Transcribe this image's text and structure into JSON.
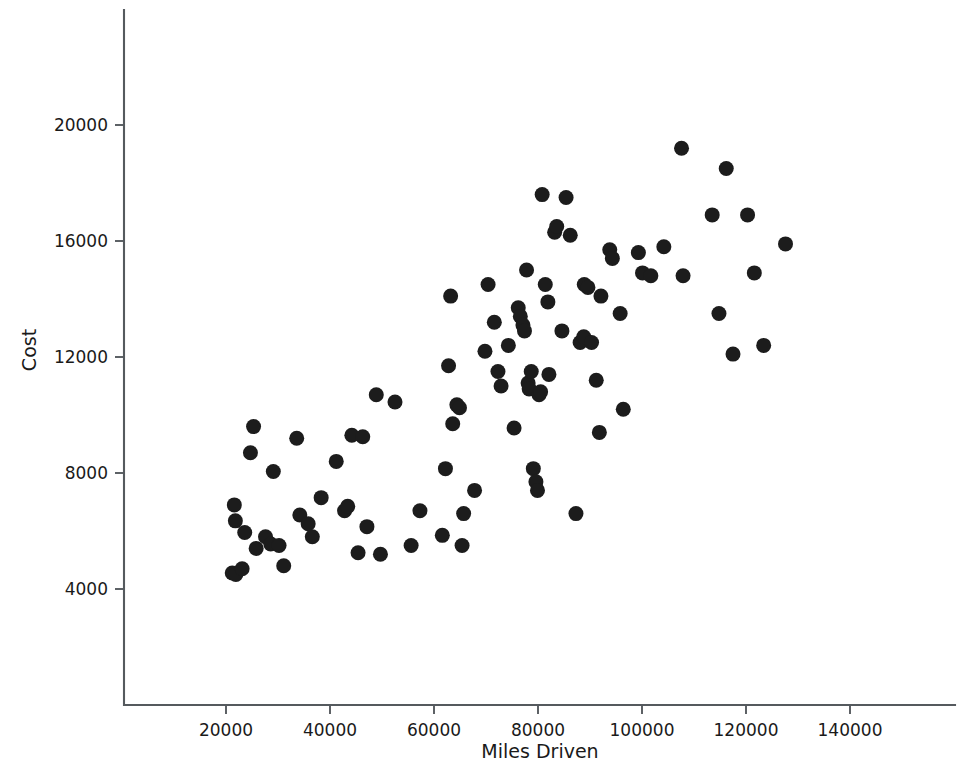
{
  "figure": {
    "background_color": "#ffffff",
    "marker_color": "#1c1c1c",
    "axis_color": "#555a5e",
    "line_color": "#2a2a2a"
  },
  "axes": {
    "x_title": "Miles Driven",
    "y_title": "Cost",
    "x_ticks": [
      "20000",
      "40000",
      "60000",
      "80000",
      "100000",
      "120000",
      "140000"
    ],
    "y_ticks": [
      "4000",
      "8000",
      "12000",
      "16000",
      "20000"
    ]
  },
  "chart_data": {
    "type": "scatter",
    "title": "",
    "subtitle": "",
    "xlabel": "Miles Driven",
    "ylabel": "Cost",
    "xlim": [
      0,
      160000
    ],
    "ylim": [
      0,
      24000
    ],
    "x_ticks": [
      20000,
      40000,
      60000,
      80000,
      100000,
      120000,
      140000
    ],
    "y_ticks": [
      4000,
      8000,
      12000,
      16000,
      20000
    ],
    "grid": false,
    "legend": null,
    "legend_position": "none",
    "marker": {
      "shape": "circle",
      "color": "#1c1c1c",
      "size_px": 15,
      "filled": true
    },
    "annotations": [],
    "series": [
      {
        "name": "Vehicles",
        "type": "scatter",
        "points": [
          [
            21200,
            4550
          ],
          [
            21900,
            4500
          ],
          [
            23100,
            4700
          ],
          [
            21600,
            6900
          ],
          [
            21800,
            6350
          ],
          [
            23600,
            5950
          ],
          [
            24700,
            8700
          ],
          [
            25300,
            9600
          ],
          [
            25800,
            5400
          ],
          [
            27600,
            5800
          ],
          [
            28600,
            5550
          ],
          [
            29100,
            8050
          ],
          [
            30200,
            5500
          ],
          [
            31100,
            4800
          ],
          [
            33600,
            9200
          ],
          [
            34200,
            6550
          ],
          [
            35800,
            6250
          ],
          [
            36600,
            5800
          ],
          [
            38300,
            7150
          ],
          [
            41200,
            8400
          ],
          [
            42800,
            6700
          ],
          [
            43400,
            6850
          ],
          [
            44200,
            9300
          ],
          [
            45400,
            5250
          ],
          [
            46300,
            9250
          ],
          [
            47100,
            6150
          ],
          [
            48900,
            10700
          ],
          [
            49700,
            5200
          ],
          [
            52500,
            10450
          ],
          [
            55600,
            5500
          ],
          [
            57300,
            6700
          ],
          [
            61600,
            5850
          ],
          [
            62200,
            8150
          ],
          [
            62800,
            11700
          ],
          [
            63200,
            14100
          ],
          [
            63600,
            9700
          ],
          [
            64400,
            10350
          ],
          [
            64900,
            10250
          ],
          [
            65400,
            5500
          ],
          [
            65700,
            6600
          ],
          [
            67800,
            7400
          ],
          [
            69800,
            12200
          ],
          [
            70400,
            14500
          ],
          [
            71600,
            13200
          ],
          [
            72300,
            11500
          ],
          [
            72900,
            11000
          ],
          [
            74300,
            12400
          ],
          [
            75400,
            9550
          ],
          [
            76200,
            13700
          ],
          [
            76600,
            13400
          ],
          [
            77100,
            13100
          ],
          [
            77400,
            12900
          ],
          [
            77800,
            15000
          ],
          [
            78100,
            11100
          ],
          [
            78300,
            10900
          ],
          [
            78700,
            11500
          ],
          [
            79100,
            8150
          ],
          [
            79600,
            7700
          ],
          [
            79900,
            7400
          ],
          [
            80200,
            10700
          ],
          [
            80500,
            10800
          ],
          [
            80800,
            17600
          ],
          [
            81400,
            14500
          ],
          [
            81900,
            13900
          ],
          [
            82100,
            11400
          ],
          [
            83200,
            16300
          ],
          [
            83600,
            16500
          ],
          [
            84600,
            12900
          ],
          [
            85400,
            17500
          ],
          [
            86200,
            16200
          ],
          [
            87300,
            6600
          ],
          [
            88100,
            12500
          ],
          [
            88800,
            12700
          ],
          [
            88900,
            14500
          ],
          [
            89600,
            14400
          ],
          [
            90300,
            12500
          ],
          [
            91200,
            11200
          ],
          [
            91800,
            9400
          ],
          [
            92100,
            14100
          ],
          [
            93800,
            15700
          ],
          [
            94300,
            15400
          ],
          [
            95800,
            13500
          ],
          [
            96400,
            10200
          ],
          [
            99300,
            15600
          ],
          [
            100100,
            14900
          ],
          [
            101700,
            14800
          ],
          [
            104200,
            15800
          ],
          [
            107600,
            19200
          ],
          [
            107900,
            14800
          ],
          [
            113500,
            16900
          ],
          [
            114800,
            13500
          ],
          [
            116200,
            18500
          ],
          [
            117500,
            12100
          ],
          [
            120300,
            16900
          ],
          [
            121600,
            14900
          ],
          [
            123400,
            12400
          ],
          [
            127600,
            15900
          ]
        ]
      },
      {
        "name": "Least-squares fit",
        "type": "line",
        "points": [
          [
            22300,
            5450
          ],
          [
            127500,
            16500
          ]
        ]
      }
    ]
  }
}
